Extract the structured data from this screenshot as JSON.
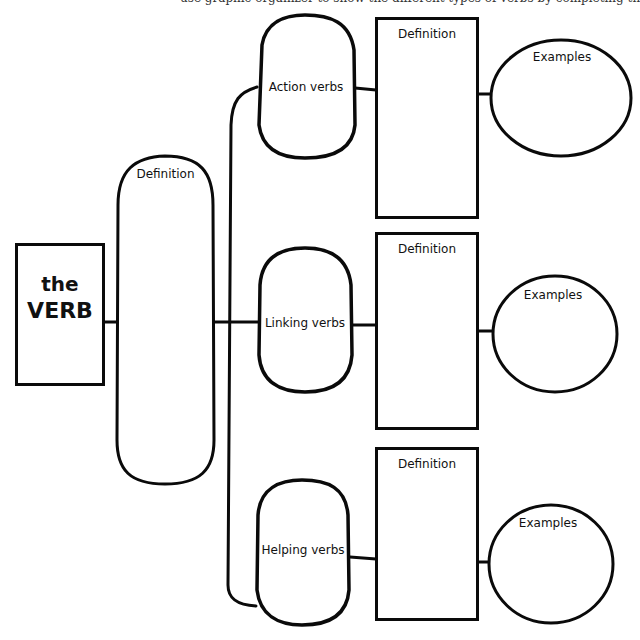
{
  "header": {
    "cut_off_text": "use graphic organizer to show the different types of verbs by completing the diagram"
  },
  "root": {
    "line1": "the",
    "line2": "VERB"
  },
  "root_definition": {
    "label": "Definition"
  },
  "branches": [
    {
      "type_label": "Action verbs",
      "definition_label": "Definition",
      "examples_label": "Examples"
    },
    {
      "type_label": "Linking verbs",
      "definition_label": "Definition",
      "examples_label": "Examples"
    },
    {
      "type_label": "Helping verbs",
      "definition_label": "Definition",
      "examples_label": "Examples"
    }
  ],
  "colors": {
    "stroke": "#0a0a0a",
    "background": "#ffffff"
  }
}
